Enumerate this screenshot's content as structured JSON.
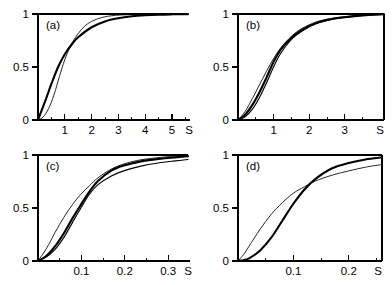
{
  "figure": {
    "panels": [
      {
        "id": "a",
        "label": "(a)",
        "y_ticks": [
          "1",
          "0.5",
          "0"
        ],
        "x_ticks": [
          "1",
          "2",
          "3",
          "4",
          "5"
        ],
        "x_axis_label": "S"
      },
      {
        "id": "b",
        "label": "(b)",
        "y_ticks": [
          "1",
          "0.5",
          "0"
        ],
        "x_ticks": [
          "1",
          "2",
          "3"
        ],
        "x_axis_label": "S"
      },
      {
        "id": "c",
        "label": "(c)",
        "y_ticks": [
          "1",
          "0.5",
          "0"
        ],
        "x_ticks": [
          "0.1",
          "0.2",
          "0.3"
        ],
        "x_axis_label": "S"
      },
      {
        "id": "d",
        "label": "(d)",
        "y_ticks": [
          "1",
          "0.5",
          "0"
        ],
        "x_ticks": [
          "0.1",
          "0.2"
        ],
        "x_axis_label": "S"
      }
    ]
  },
  "chart_data": [
    {
      "type": "line",
      "panel": "a",
      "title": "(a)",
      "xlabel": "S",
      "ylabel": "",
      "xlim": [
        0,
        5.6
      ],
      "ylim": [
        0,
        1.05
      ],
      "xticks": [
        1,
        2,
        3,
        4,
        5
      ],
      "yticks": [
        0,
        0.5,
        1
      ],
      "grid": false,
      "legend": "none",
      "series": [
        {
          "name": "thick-curve",
          "style": "thick",
          "x": [
            0,
            0.15,
            0.3,
            0.5,
            0.75,
            1.0,
            1.25,
            1.5,
            2.0,
            2.5,
            3.0,
            3.5,
            4.0,
            4.5,
            5.0,
            5.6
          ],
          "values": [
            0,
            0.1,
            0.2,
            0.34,
            0.5,
            0.62,
            0.71,
            0.78,
            0.875,
            0.93,
            0.96,
            0.978,
            0.988,
            0.994,
            0.997,
            0.999
          ]
        },
        {
          "name": "thin-curve",
          "style": "thin",
          "x": [
            0,
            0.2,
            0.4,
            0.6,
            0.8,
            1.0,
            1.2,
            1.4,
            1.7,
            2.0,
            2.4,
            2.8,
            3.2,
            3.8,
            4.4,
            5.0,
            5.6
          ],
          "values": [
            0,
            0.03,
            0.11,
            0.24,
            0.41,
            0.57,
            0.69,
            0.78,
            0.875,
            0.93,
            0.968,
            0.985,
            0.992,
            0.997,
            0.999,
            1.0,
            1.0
          ]
        }
      ]
    },
    {
      "type": "line",
      "panel": "b",
      "title": "(b)",
      "xlabel": "S",
      "ylabel": "",
      "xlim": [
        0,
        4.1
      ],
      "ylim": [
        0,
        1.05
      ],
      "xticks": [
        1,
        2,
        3
      ],
      "yticks": [
        0,
        0.5,
        1
      ],
      "grid": false,
      "legend": "none",
      "series": [
        {
          "name": "upper-thin-curve",
          "style": "thin",
          "x": [
            0,
            0.2,
            0.4,
            0.6,
            0.8,
            1.0,
            1.2,
            1.5,
            1.8,
            2.2,
            2.6,
            3.0,
            3.5,
            4.1
          ],
          "values": [
            0,
            0.08,
            0.2,
            0.33,
            0.46,
            0.58,
            0.68,
            0.79,
            0.865,
            0.925,
            0.957,
            0.975,
            0.99,
            0.998
          ]
        },
        {
          "name": "thick-curve",
          "style": "thick",
          "x": [
            0,
            0.2,
            0.4,
            0.6,
            0.8,
            1.0,
            1.2,
            1.5,
            1.8,
            2.2,
            2.6,
            3.0,
            3.5,
            4.1
          ],
          "values": [
            0,
            0.05,
            0.14,
            0.26,
            0.4,
            0.55,
            0.665,
            0.775,
            0.85,
            0.915,
            0.95,
            0.97,
            0.987,
            0.997
          ]
        },
        {
          "name": "lower-thin-curve",
          "style": "mid",
          "x": [
            0,
            0.2,
            0.4,
            0.6,
            0.8,
            1.0,
            1.2,
            1.5,
            1.8,
            2.2,
            2.6,
            3.0,
            3.5,
            4.1
          ],
          "values": [
            0,
            0.03,
            0.1,
            0.21,
            0.35,
            0.5,
            0.63,
            0.76,
            0.84,
            0.91,
            0.947,
            0.968,
            0.986,
            0.997
          ]
        }
      ]
    },
    {
      "type": "line",
      "panel": "c",
      "title": "(c)",
      "xlabel": "S",
      "ylabel": "",
      "xlim": [
        0,
        0.35
      ],
      "ylim": [
        0,
        1.05
      ],
      "xticks": [
        0.1,
        0.2,
        0.3
      ],
      "yticks": [
        0,
        0.5,
        1
      ],
      "grid": false,
      "legend": "none",
      "series": [
        {
          "name": "steep-thin-curve",
          "style": "thin",
          "x": [
            0,
            0.02,
            0.04,
            0.06,
            0.08,
            0.1,
            0.12,
            0.14,
            0.17,
            0.2,
            0.24,
            0.28,
            0.32,
            0.35
          ],
          "values": [
            0,
            0.12,
            0.27,
            0.41,
            0.53,
            0.63,
            0.71,
            0.785,
            0.865,
            0.915,
            0.955,
            0.975,
            0.99,
            0.997
          ]
        },
        {
          "name": "thick-curve",
          "style": "thick",
          "x": [
            0,
            0.02,
            0.04,
            0.06,
            0.08,
            0.1,
            0.12,
            0.14,
            0.17,
            0.2,
            0.24,
            0.28,
            0.32,
            0.35
          ],
          "values": [
            0,
            0.05,
            0.14,
            0.26,
            0.4,
            0.53,
            0.655,
            0.755,
            0.85,
            0.9,
            0.94,
            0.962,
            0.978,
            0.988
          ]
        },
        {
          "name": "shallow-thin-curve",
          "style": "mid",
          "x": [
            0,
            0.02,
            0.04,
            0.06,
            0.08,
            0.1,
            0.12,
            0.14,
            0.17,
            0.2,
            0.24,
            0.28,
            0.32,
            0.35
          ],
          "values": [
            0,
            0.04,
            0.11,
            0.22,
            0.36,
            0.5,
            0.63,
            0.72,
            0.8,
            0.85,
            0.895,
            0.925,
            0.945,
            0.958
          ]
        }
      ]
    },
    {
      "type": "line",
      "panel": "d",
      "title": "(d)",
      "xlabel": "S",
      "ylabel": "",
      "xlim": [
        0,
        0.26
      ],
      "ylim": [
        0,
        1.05
      ],
      "xticks": [
        0.1,
        0.2
      ],
      "yticks": [
        0,
        0.5,
        1
      ],
      "grid": false,
      "legend": "none",
      "series": [
        {
          "name": "thin-curve",
          "style": "thin",
          "x": [
            0,
            0.01,
            0.02,
            0.04,
            0.06,
            0.08,
            0.1,
            0.12,
            0.14,
            0.17,
            0.2,
            0.23,
            0.26
          ],
          "values": [
            0,
            0.06,
            0.14,
            0.3,
            0.44,
            0.55,
            0.64,
            0.7,
            0.755,
            0.81,
            0.85,
            0.885,
            0.91
          ]
        },
        {
          "name": "thick-curve",
          "style": "thick",
          "x": [
            0,
            0.01,
            0.02,
            0.04,
            0.06,
            0.08,
            0.1,
            0.12,
            0.14,
            0.17,
            0.2,
            0.23,
            0.26
          ],
          "values": [
            0,
            0.008,
            0.025,
            0.1,
            0.22,
            0.38,
            0.54,
            0.675,
            0.775,
            0.875,
            0.925,
            0.958,
            0.978
          ]
        }
      ]
    }
  ]
}
